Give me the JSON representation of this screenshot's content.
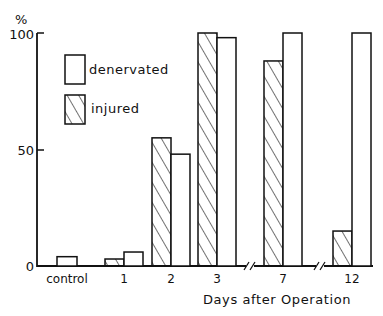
{
  "chart_data": {
    "type": "bar",
    "title": "",
    "ylabel": "%",
    "xlabel": "Days after Operation",
    "ylim": [
      0,
      100
    ],
    "yticks": [
      0,
      50,
      100
    ],
    "grid": false,
    "legend_position": "upper-left inside plot",
    "categories": [
      "control",
      "1",
      "2",
      "3",
      "7",
      "12"
    ],
    "axis_breaks_between": [
      [
        "3",
        "7"
      ],
      [
        "7",
        "12"
      ]
    ],
    "series": [
      {
        "name": "injured",
        "pattern": "diagonal-hatch",
        "values": [
          null,
          3,
          55,
          100,
          88,
          15
        ]
      },
      {
        "name": "denervated",
        "pattern": "open",
        "values": [
          4,
          6,
          48,
          98,
          100,
          100
        ]
      }
    ]
  },
  "axis": {
    "y_unit": "%",
    "y_ticks": [
      "100",
      "50",
      "0"
    ],
    "x_title": "Days after Operation"
  },
  "legend": {
    "denervated": "denervated",
    "injured": "injured"
  },
  "colors": {
    "ink": "#111111",
    "background": "#ffffff"
  }
}
